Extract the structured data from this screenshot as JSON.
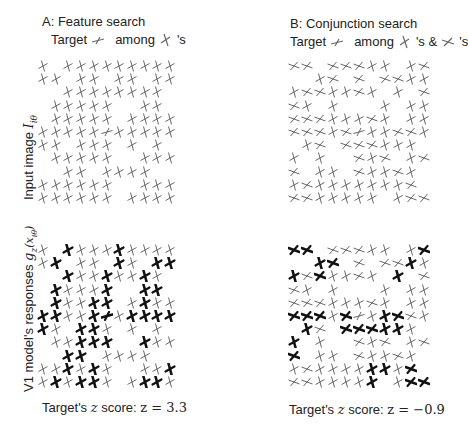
{
  "panels": [
    {
      "id": "A",
      "title": "A: Feature search",
      "subtitle": {
        "prefix": "Target",
        "middle": "among",
        "suffix": "'s",
        "target_glyph": "target-bar",
        "distractor_glyphs": [
          "vertical-cross"
        ]
      },
      "caption": {
        "text": "Target's",
        "var": "z",
        "rest": "score:",
        "eq": "z = 3.3"
      },
      "input_grid": [
        "v.vvvvvvvvv",
        "vv.vv.vv.vv",
        "..vvvvvvvv.",
        ".vvvvv..vv.",
        ".vvvvv.vvvv",
        "vvvvvTvvvvv",
        "vv.vvv.v.v.",
        ".vvvvv..vvv",
        "..vv.vvvv..",
        "vvvvvv..vvv",
        "vvvvvv.vvvv"
      ],
      "response_bold": [
        "..B...B....",
        ".B....B..BB",
        "..B..B..B..",
        ".B...B..BB.",
        ".B..BB..B..",
        "BB..BT.BBBB",
        "B..BB...B..",
        "...BBB..B..",
        "..BB.......",
        "..B.B.....B",
        ".B.BB...BB."
      ]
    },
    {
      "id": "B",
      "title": "B: Conjunction search",
      "subtitle": {
        "prefix": "Target",
        "middle": "among",
        "suffix": "'s &",
        "suffix2": "'s",
        "target_glyph": "target-bar",
        "distractor_glyphs": [
          "vertical-cross",
          "horizontal-cross"
        ]
      },
      "caption": {
        "text": "Target's",
        "var": "z",
        "rest": "score:",
        "eq": "z = −0.9"
      },
      "input_grid": [
        "hh.hhhvv.vh",
        "..vh.h.hhvv",
        "vhhvvhv.v.h",
        "hv.v...v.vv",
        "hhhvvvhv.vv",
        "hhhvhTvvhhv",
        ".vh.hhhvvv.",
        "v.v..hvh.vh",
        "h.vv.hvvhv.",
        "vhvvvvvvvh.",
        "hhvvvvv.vhh"
      ],
      "response_bold": [
        "BB........B",
        "..BB.....B.",
        "B.B.....B..",
        "........B..",
        "........B..",
        "BBB.B..BB..",
        ".B..BBBBB..",
        "B.......B..",
        "B.........B",
        "......BB.B.",
        "......B..BB"
      ]
    }
  ],
  "row_labels": {
    "top": "Input image",
    "top_math": "I",
    "top_sub": "iθ",
    "bottom": "V1 model's responses",
    "bottom_math": "g",
    "bottom_sub": "z",
    "bottom_arg": "(x",
    "bottom_arg_sub": "iθ",
    "bottom_close": ")"
  },
  "colors": {
    "stroke": "#555555",
    "bold": "#111111",
    "text": "#222222"
  }
}
